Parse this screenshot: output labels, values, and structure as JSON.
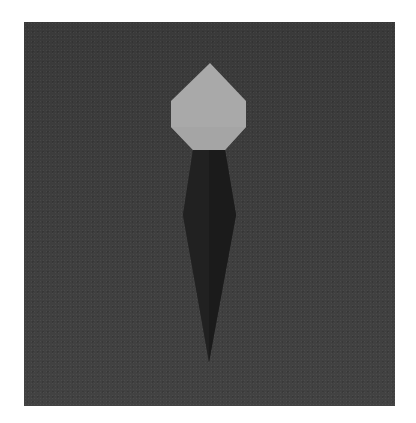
{
  "scene": {
    "description": "Origami figure: a light gray heptagonal head atop a long dark tapering body, on a dark textured paper background",
    "colors": {
      "page": "#ffffff",
      "background_paper": "#3c3c3c",
      "head": "#a9a9a9",
      "head_shade": "#9c9c9c",
      "body": "#1f1f1f",
      "body_shade": "#171717"
    }
  }
}
